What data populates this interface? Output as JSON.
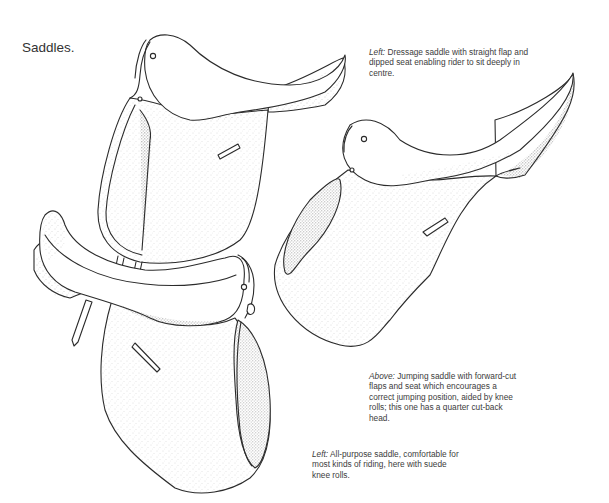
{
  "page": {
    "title": "Saddles."
  },
  "captions": {
    "dressage": {
      "lead": "Left:",
      "text": " Dressage saddle with straight flap and dipped seat enabling rider to sit deeply in centre."
    },
    "jumping": {
      "lead": "Above:",
      "text": " Jumping saddle with forward-cut flaps and seat which encourages a correct jumping position, aided by knee rolls; this one has a quarter cut-back head."
    },
    "all_purpose": {
      "lead": "Left:",
      "text": " All-purpose saddle, comfortable for most kinds of riding, here with suede knee rolls."
    }
  },
  "illustrations": [
    {
      "id": "dressage-saddle",
      "label": "Dressage saddle"
    },
    {
      "id": "jumping-saddle",
      "label": "Jumping saddle"
    },
    {
      "id": "all-purpose-saddle",
      "label": "All-purpose saddle"
    }
  ]
}
